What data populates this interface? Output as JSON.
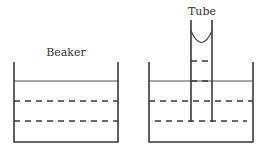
{
  "labels": {
    "beaker": "Beaker",
    "tube": "Tube"
  },
  "colors": {
    "line": "#3a3a3a"
  },
  "diagram": {
    "left_panel": {
      "label": "Beaker",
      "surface": "solid line",
      "levels": [
        "dashed",
        "dashed"
      ]
    },
    "right_panel": {
      "label": "Tube",
      "tube_meniscus": "concave",
      "levels": [
        "dashed (inside tube)",
        "solid surface",
        "dashed",
        "dashed"
      ]
    }
  }
}
